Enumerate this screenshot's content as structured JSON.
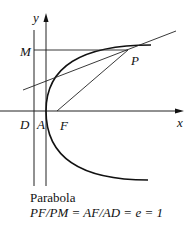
{
  "diagram": {
    "title": "Parabola",
    "equation": "PF/PM = AF/AD = e = 1",
    "labels": {
      "y_axis": "y",
      "x_axis": "x",
      "M": "M",
      "P": "P",
      "D": "D",
      "A": "A",
      "F": "F"
    },
    "colors": {
      "ink": "#111111",
      "background": "#ffffff"
    },
    "elements": [
      "y-axis with arrow",
      "x-axis with arrow",
      "directrix line through D",
      "parabola with vertex A and focus F",
      "tangent line at P",
      "segment PM parallel to x-axis",
      "segment PF"
    ]
  }
}
